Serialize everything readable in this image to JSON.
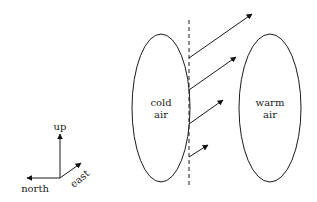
{
  "diagram": {
    "cold_mass": {
      "line1": "cold",
      "line2": "air"
    },
    "warm_mass": {
      "line1": "warm",
      "line2": "air"
    },
    "compass": {
      "up": "up",
      "north": "north",
      "east": "east"
    },
    "front_arrows": 4,
    "colors": {
      "stroke": "#1a1a1a",
      "text": "#222222",
      "background": "#ffffff"
    }
  }
}
